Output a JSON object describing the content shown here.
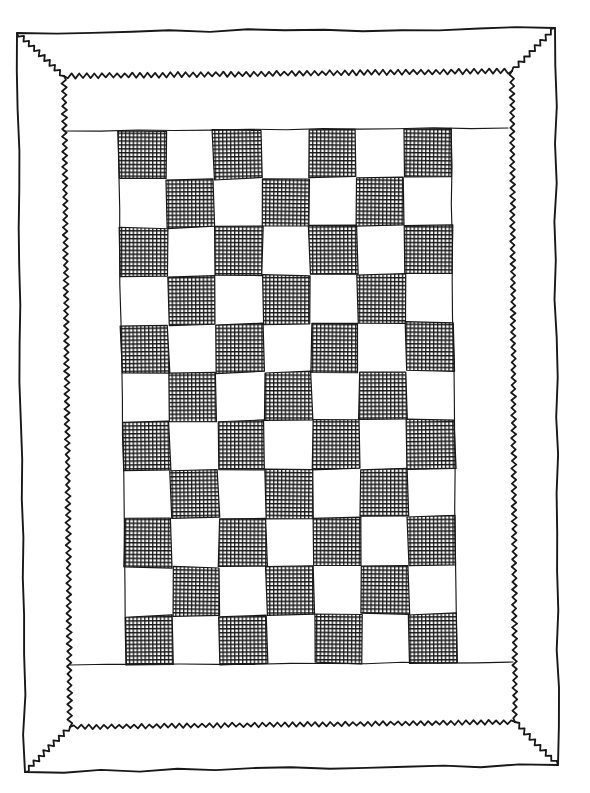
{
  "scene": {
    "type": "hand-drawn pen illustration",
    "subject": "patchwork quilt with checkerboard center field and zigzag stitched frame",
    "background_color": "#ffffff",
    "ink_color": "#181818"
  },
  "quilt": {
    "outer_binding": {
      "shape": "rectangle",
      "line_style": "solid hand-drawn"
    },
    "stitch_frame": {
      "line_style": "zigzag rickrack",
      "corner_style": "mitered diagonals joining outer corners"
    },
    "inner_field": {
      "seam_lines": [
        "top",
        "bottom"
      ],
      "margin_color": "#ffffff"
    },
    "checkerboard": {
      "rows": 11,
      "cols": 7,
      "first_cell_top_left": "dark",
      "alternation": "dark where row+col is even",
      "dark_cell_fill": "crosshatch",
      "dark_cell_color": "#181818",
      "light_cell_color": "#ffffff",
      "dark_cell_count": 39,
      "light_cell_count": 38
    }
  }
}
